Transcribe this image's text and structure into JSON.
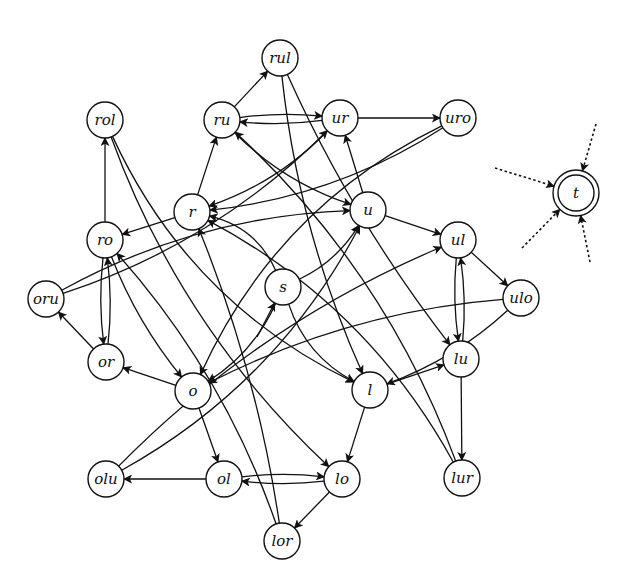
{
  "diagram": {
    "title": "",
    "nodes": [
      {
        "id": "rul",
        "label": "rul"
      },
      {
        "id": "rol",
        "label": "rol"
      },
      {
        "id": "ru",
        "label": "ru"
      },
      {
        "id": "ur",
        "label": "ur"
      },
      {
        "id": "uro",
        "label": "uro"
      },
      {
        "id": "r",
        "label": "r"
      },
      {
        "id": "u",
        "label": "u"
      },
      {
        "id": "ro",
        "label": "ro"
      },
      {
        "id": "ul",
        "label": "ul"
      },
      {
        "id": "s",
        "label": "s"
      },
      {
        "id": "oru",
        "label": "oru"
      },
      {
        "id": "ulo",
        "label": "ulo"
      },
      {
        "id": "or",
        "label": "or"
      },
      {
        "id": "o",
        "label": "o"
      },
      {
        "id": "l",
        "label": "l"
      },
      {
        "id": "lu",
        "label": "lu"
      },
      {
        "id": "olu",
        "label": "olu"
      },
      {
        "id": "ol",
        "label": "ol"
      },
      {
        "id": "lo",
        "label": "lo"
      },
      {
        "id": "lur",
        "label": "lur"
      },
      {
        "id": "lor",
        "label": "lor"
      },
      {
        "id": "t",
        "label": "t",
        "accepting": true
      }
    ],
    "edges": [
      {
        "from": "ru",
        "to": "rul"
      },
      {
        "from": "ru",
        "to": "ur"
      },
      {
        "from": "ur",
        "to": "ru"
      },
      {
        "from": "ur",
        "to": "uro"
      },
      {
        "from": "ro",
        "to": "rol"
      },
      {
        "from": "r",
        "to": "ru"
      },
      {
        "from": "r",
        "to": "ro"
      },
      {
        "from": "u",
        "to": "ur"
      },
      {
        "from": "u",
        "to": "ul"
      },
      {
        "from": "ul",
        "to": "ulo"
      },
      {
        "from": "ul",
        "to": "lu"
      },
      {
        "from": "lu",
        "to": "ul"
      },
      {
        "from": "lu",
        "to": "lur"
      },
      {
        "from": "l",
        "to": "lu"
      },
      {
        "from": "l",
        "to": "lo"
      },
      {
        "from": "lo",
        "to": "ol"
      },
      {
        "from": "ol",
        "to": "lo"
      },
      {
        "from": "ol",
        "to": "olu"
      },
      {
        "from": "lo",
        "to": "lor"
      },
      {
        "from": "o",
        "to": "ol"
      },
      {
        "from": "o",
        "to": "or"
      },
      {
        "from": "or",
        "to": "oru"
      },
      {
        "from": "or",
        "to": "ro"
      },
      {
        "from": "ro",
        "to": "or"
      },
      {
        "from": "ru",
        "to": "u"
      },
      {
        "from": "ur",
        "to": "r"
      },
      {
        "from": "uro",
        "to": "r"
      },
      {
        "from": "ro",
        "to": "o"
      },
      {
        "from": "rol",
        "to": "lo"
      },
      {
        "from": "rol",
        "to": "l"
      },
      {
        "from": "rul",
        "to": "l"
      },
      {
        "from": "rul",
        "to": "lu"
      },
      {
        "from": "oru",
        "to": "u"
      },
      {
        "from": "oru",
        "to": "ur"
      },
      {
        "from": "ulo",
        "to": "o"
      },
      {
        "from": "ulo",
        "to": "l"
      },
      {
        "from": "uro",
        "to": "o"
      },
      {
        "from": "olu",
        "to": "ul"
      },
      {
        "from": "olu",
        "to": "u"
      },
      {
        "from": "lur",
        "to": "ru"
      },
      {
        "from": "lur",
        "to": "r"
      },
      {
        "from": "lor",
        "to": "r"
      },
      {
        "from": "lor",
        "to": "ro"
      },
      {
        "from": "s",
        "to": "u"
      },
      {
        "from": "s",
        "to": "o"
      },
      {
        "from": "s",
        "to": "l"
      },
      {
        "from": "s",
        "to": "r"
      },
      {
        "from": "start",
        "to": "s"
      }
    ],
    "incoming_dotted_to_t": 4
  }
}
